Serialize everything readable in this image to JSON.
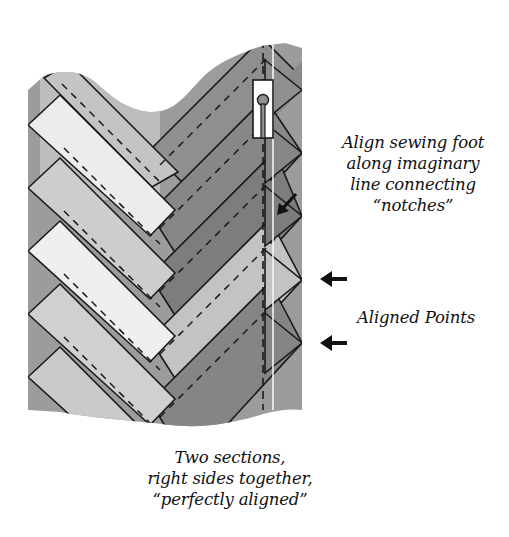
{
  "figure": {
    "type": "quilting-technique-illustration",
    "colors": {
      "background": "#ffffff",
      "light_strip": "#ececec",
      "medium_strip": "#c9c9c9",
      "dark_strip": "#8a8a8a",
      "darker_strip": "#7b7b7b",
      "backing_fabric": "#9a9a9a",
      "outline": "#1a1a1a",
      "stitch_line": "#1a1a1a",
      "guide_line": "#f4f4f4"
    }
  },
  "annotations": {
    "foot_instruction": {
      "lines": [
        "Align sewing foot",
        "along imaginary",
        "line connecting",
        "“notches”"
      ]
    },
    "aligned_points": {
      "label": "Aligned Points"
    },
    "caption": {
      "lines": [
        "Two sections,",
        "right sides together,",
        "“perfectly aligned”"
      ]
    }
  },
  "icons": {
    "notch_pointer": "diagonal-arrow-icon",
    "aligned_point_arrow_1": "left-arrow-icon",
    "aligned_point_arrow_2": "left-arrow-icon",
    "sewing_foot": "presser-foot-icon"
  }
}
